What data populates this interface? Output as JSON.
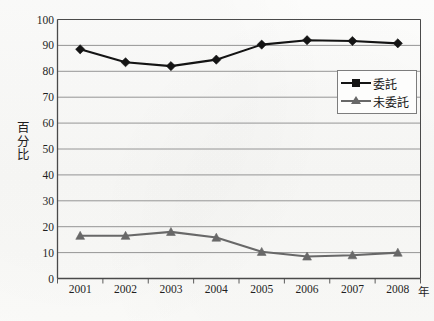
{
  "chart_data": {
    "type": "line",
    "title": "",
    "xlabel": "年",
    "ylabel": "百分比",
    "ylabel_chars": [
      "百",
      "分",
      "比"
    ],
    "categories": [
      "2001",
      "2002",
      "2003",
      "2004",
      "2005",
      "2006",
      "2007",
      "2008"
    ],
    "x": [
      2001,
      2002,
      2003,
      2004,
      2005,
      2006,
      2007,
      2008
    ],
    "ylim": [
      0,
      100
    ],
    "yticks": [
      0,
      10,
      20,
      30,
      40,
      50,
      60,
      70,
      80,
      90,
      100
    ],
    "ytick_labels": [
      "0",
      "10",
      "20",
      "30",
      "40",
      "50",
      "60",
      "70",
      "80",
      "90",
      "100"
    ],
    "grid": "horizontal",
    "legend_position": "top-right",
    "series": [
      {
        "name": "委託",
        "marker": "diamond",
        "color": "#141414",
        "values": [
          88.5,
          83.5,
          82.0,
          84.5,
          90.3,
          92.0,
          91.7,
          90.8
        ]
      },
      {
        "name": "未委託",
        "marker": "triangle",
        "color": "#686868",
        "values": [
          16.5,
          16.5,
          18.0,
          15.8,
          10.3,
          8.5,
          9.0,
          10.0
        ]
      }
    ]
  },
  "legend": {
    "items": [
      {
        "label": "委託"
      },
      {
        "label": "未委託"
      }
    ]
  },
  "colors": {
    "series_1": "#141414",
    "series_2": "#686868",
    "gridline": "#8a8a8a",
    "axis": "#4a4a4a",
    "background": "#fbfbfa"
  }
}
